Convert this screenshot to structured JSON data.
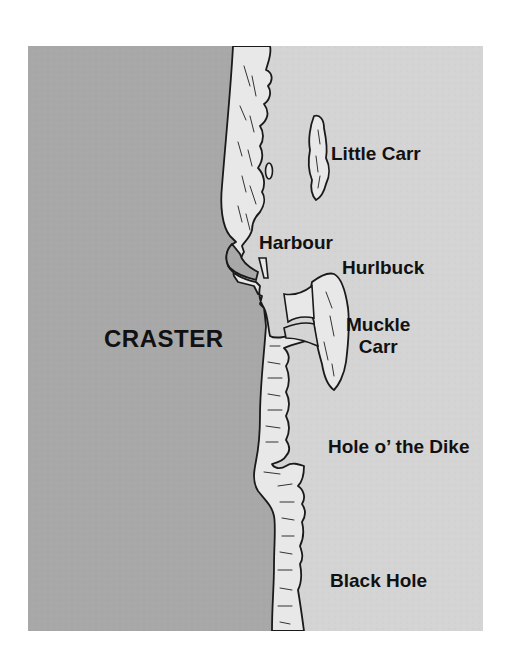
{
  "map": {
    "colors": {
      "land": "#a8a8a8",
      "sea": "#d4d4d4",
      "rock": "#e8e8e8",
      "outline": "#1a1a1a",
      "text": "#111111"
    },
    "labels": {
      "town": "CRASTER",
      "little_carr": "Little Carr",
      "harbour": "Harbour",
      "hurlbuck": "Hurlbuck",
      "muckle_carr_line1": "Muckle",
      "muckle_carr_line2": "Carr",
      "hole_o_the_dike": "Hole o’ the Dike",
      "black_hole": "Black Hole"
    }
  }
}
